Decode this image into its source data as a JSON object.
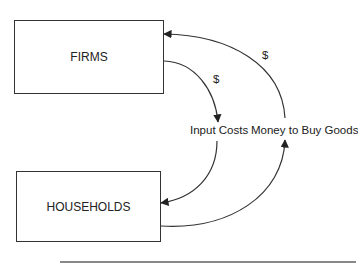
{
  "diagram": {
    "type": "circular-flow",
    "nodes": [
      {
        "id": "firms",
        "label": "FIRMS"
      },
      {
        "id": "households",
        "label": "HOUSEHOLDS"
      }
    ],
    "flows": [
      {
        "from": "firms",
        "to": "households",
        "label": "Input Costs",
        "marker": "$"
      },
      {
        "from": "households",
        "to": "firms",
        "label": "Money to Buy Goods",
        "marker": "$"
      }
    ]
  },
  "labels": {
    "firms": "FIRMS",
    "households": "HOUSEHOLDS",
    "input_costs": "Input Costs",
    "money_to_buy_goods": "Money to Buy Goods",
    "dollar_inner": "$",
    "dollar_outer": "$"
  },
  "colors": {
    "stroke": "#333333",
    "text": "#222222",
    "rule": "#888888"
  }
}
